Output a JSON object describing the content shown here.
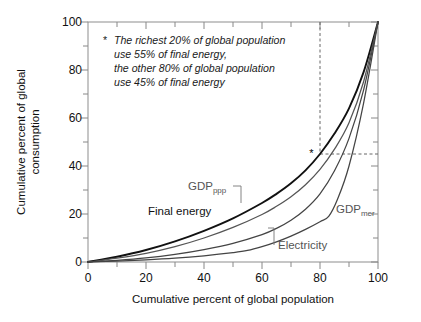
{
  "chart_data": {
    "type": "line",
    "title": "",
    "xlabel": "Cumulative percent of global population",
    "ylabel": "Cumulative percent of global consumption",
    "xlim": [
      0,
      100
    ],
    "ylim": [
      0,
      100
    ],
    "xticks": [
      0,
      20,
      40,
      60,
      80,
      100
    ],
    "yticks": [
      0,
      20,
      40,
      60,
      80,
      100
    ],
    "xminorticks": [
      10,
      30,
      50,
      70,
      90
    ],
    "yminorticks": [
      10,
      30,
      50,
      70,
      90
    ],
    "grid": false,
    "legend": "inline-labels",
    "series": [
      {
        "name": "Final energy",
        "color": "#111111",
        "x": [
          0,
          10,
          20,
          30,
          40,
          50,
          60,
          65,
          70,
          75,
          80,
          85,
          90,
          95,
          100
        ],
        "y": [
          0,
          2.2,
          5.0,
          8.6,
          13.0,
          18.2,
          24.6,
          28.4,
          32.8,
          38.2,
          45.0,
          53.5,
          64.0,
          79.0,
          100
        ]
      },
      {
        "name": "GDPppp",
        "color": "#555555",
        "x": [
          0,
          10,
          20,
          30,
          40,
          50,
          60,
          65,
          70,
          75,
          80,
          85,
          90,
          95,
          100
        ],
        "y": [
          0,
          1.6,
          3.6,
          6.4,
          10.0,
          14.4,
          19.8,
          23.2,
          27.2,
          32.2,
          38.6,
          47.0,
          58.0,
          75.0,
          100
        ]
      },
      {
        "name": "Electricity",
        "color": "#444444",
        "x": [
          0,
          10,
          20,
          30,
          40,
          50,
          60,
          65,
          70,
          75,
          80,
          85,
          90,
          95,
          100
        ],
        "y": [
          0,
          0.7,
          1.7,
          3.2,
          5.2,
          7.8,
          11.4,
          14.0,
          17.4,
          22.0,
          28.4,
          38.0,
          51.5,
          71.5,
          100
        ]
      },
      {
        "name": "GDPmer",
        "color": "#444444",
        "x": [
          0,
          10,
          20,
          30,
          40,
          50,
          55,
          60,
          65,
          70,
          75,
          80,
          83,
          86,
          90,
          95,
          100
        ],
        "y": [
          0,
          0.4,
          0.9,
          1.6,
          2.6,
          3.9,
          4.8,
          6.4,
          8.4,
          10.8,
          13.6,
          16.8,
          19.0,
          26.0,
          40.0,
          66.0,
          100
        ]
      }
    ],
    "reference_lines": {
      "vertical_x": 80,
      "horizontal_y": 45,
      "style": "dashed",
      "marker": "*",
      "marker_x": 77,
      "marker_y": 45
    },
    "annotation": {
      "star": "*",
      "lines": [
        "The richest 20% of global population",
        "use 55% of final energy,",
        "the other 80% of global population",
        "use 45% of final energy"
      ]
    },
    "series_labels": [
      {
        "id": "final-energy",
        "text": "Final energy",
        "sub": ""
      },
      {
        "id": "gdp-ppp",
        "text": "GDP",
        "sub": "ppp"
      },
      {
        "id": "gdp-mer",
        "text": "GDP",
        "sub": "mer"
      },
      {
        "id": "electricity",
        "text": "Electricity",
        "sub": ""
      }
    ]
  },
  "axes": {
    "x_label": "Cumulative percent of global population",
    "y_label_line1": "Cumulative percent of global",
    "y_label_line2": "consumption",
    "x_tick_0": "0",
    "x_tick_1": "20",
    "x_tick_2": "40",
    "x_tick_3": "60",
    "x_tick_4": "80",
    "x_tick_5": "100",
    "y_tick_0": "0",
    "y_tick_1": "20",
    "y_tick_2": "40",
    "y_tick_3": "60",
    "y_tick_4": "80",
    "y_tick_5": "100"
  },
  "note": {
    "star": "*",
    "line1": "The richest 20% of global population",
    "line2": "use 55% of final energy,",
    "line3": "the other 80% of global population",
    "line4": "use 45% of final energy"
  },
  "labels": {
    "final_energy": "Final energy",
    "gdp": "GDP",
    "gdp_ppp_sub": "ppp",
    "gdp_mer_sub": "mer",
    "electricity": "Electricity",
    "star_marker": "*"
  },
  "colors": {
    "final_energy": "#111111",
    "gdp_ppp": "#555555",
    "electricity": "#444444",
    "gdp_mer": "#444444",
    "axis": "#888888",
    "text": "#111111",
    "dash": "#444444"
  }
}
